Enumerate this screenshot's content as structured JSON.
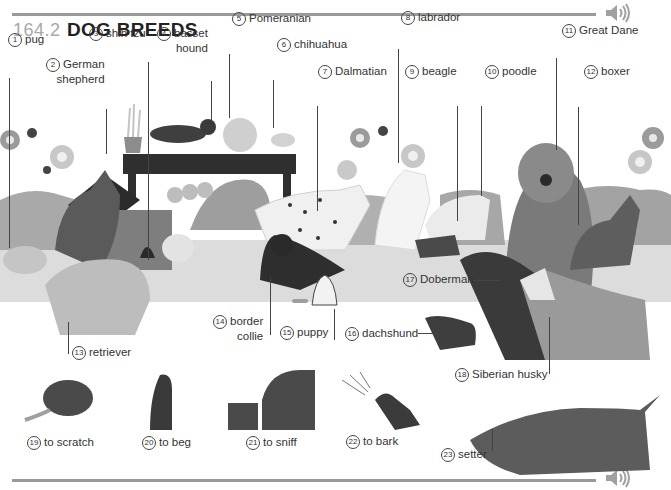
{
  "header": {
    "section_number": "164.2",
    "title": "DOG BREEDS",
    "audio_icon": "speaker-icon"
  },
  "footer": {
    "audio_icon": "speaker-icon"
  },
  "colors": {
    "rule": "#9a9a9a",
    "title_number": "#a8a8a8",
    "title_text": "#222222",
    "ground": "#d9d9d9",
    "hedge": "#a6a6a6"
  },
  "labels": [
    {
      "num": "1",
      "text": "pug"
    },
    {
      "num": "2",
      "text": "German",
      "text2": "shepherd"
    },
    {
      "num": "3",
      "text": "shih tzu"
    },
    {
      "num": "4",
      "text": "basset",
      "text2": "hound"
    },
    {
      "num": "5",
      "text": "Pomeranian"
    },
    {
      "num": "6",
      "text": "chihuahua"
    },
    {
      "num": "7",
      "text": "Dalmatian"
    },
    {
      "num": "8",
      "text": "labrador"
    },
    {
      "num": "9",
      "text": "beagle"
    },
    {
      "num": "10",
      "text": "poodle"
    },
    {
      "num": "11",
      "text": "Great Dane"
    },
    {
      "num": "12",
      "text": "boxer"
    },
    {
      "num": "13",
      "text": "retriever"
    },
    {
      "num": "14",
      "text": "border",
      "text2": "collie"
    },
    {
      "num": "15",
      "text": "puppy"
    },
    {
      "num": "16",
      "text": "dachshund"
    },
    {
      "num": "17",
      "text": "Doberman"
    },
    {
      "num": "18",
      "text": "Siberian husky"
    },
    {
      "num": "19",
      "text": "to scratch"
    },
    {
      "num": "20",
      "text": "to beg"
    },
    {
      "num": "21",
      "text": "to sniff"
    },
    {
      "num": "22",
      "text": "to bark"
    },
    {
      "num": "23",
      "text": "setter"
    }
  ]
}
